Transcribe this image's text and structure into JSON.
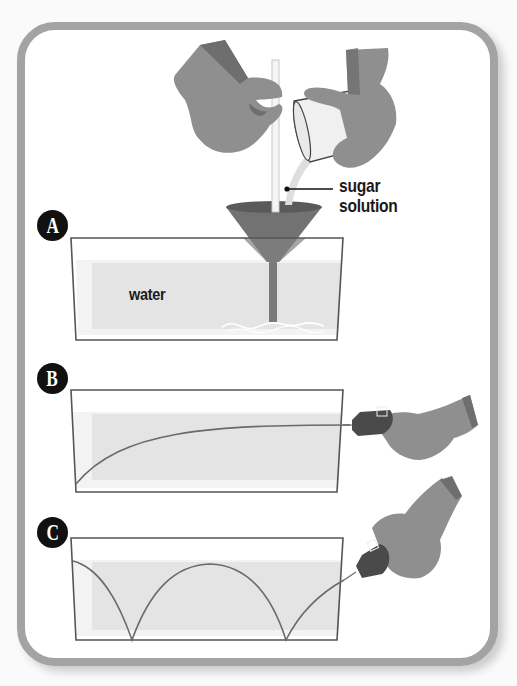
{
  "figure": {
    "steps": [
      {
        "id": "A",
        "label": "A",
        "description": "Sugar solution poured through a funnel into a tank of water"
      },
      {
        "id": "B",
        "label": "B",
        "description": "Light beam shone into tank bends downward in a smooth curve"
      },
      {
        "id": "C",
        "label": "C",
        "description": "Light beam shone at an angle bounces along the bottom in arcs"
      }
    ],
    "annotations": {
      "callout": [
        "sugar",
        "solution"
      ],
      "water": "water"
    },
    "colors": {
      "frame_border": "#a3a3a3",
      "glove": "#8f8f8f",
      "glove_shadow": "#6e6e6e",
      "funnel": "#727272",
      "water": "#e4e4e4",
      "tank_outline": "#555555",
      "beam": "#6a6a6a",
      "badge": "#111111",
      "laser_pointer": "#4a4a4a"
    }
  }
}
